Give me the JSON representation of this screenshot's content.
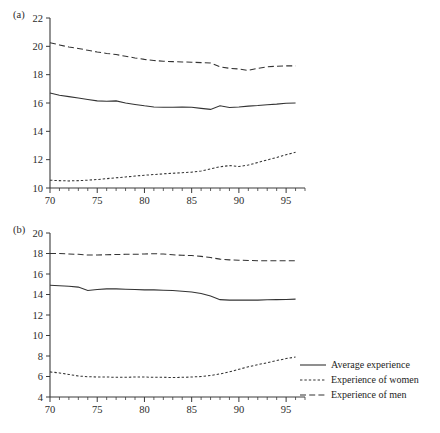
{
  "figure": {
    "panels": [
      {
        "label": "(a)",
        "name": "panel-a",
        "xlim": [
          70,
          97
        ],
        "ylim": [
          10,
          22
        ],
        "yticks": [
          10,
          12,
          14,
          16,
          18,
          20,
          22
        ],
        "xticks": [
          70,
          75,
          80,
          85,
          90,
          95
        ],
        "xminor_step": 1
      },
      {
        "label": "(b)",
        "name": "panel-b",
        "xlim": [
          70,
          97
        ],
        "ylim": [
          4,
          20
        ],
        "yticks": [
          4,
          6,
          8,
          10,
          12,
          14,
          16,
          18,
          20
        ],
        "xticks": [
          70,
          75,
          80,
          85,
          90,
          95
        ],
        "xminor_step": 1
      }
    ]
  },
  "legend": {
    "position": "right-bottom",
    "items": [
      {
        "label": "Average experience",
        "style": "solid",
        "key": "avg-line-key"
      },
      {
        "label": "Experience of women",
        "style": "dotted",
        "key": "women-line-key"
      },
      {
        "label": "Experience of men",
        "style": "dashed",
        "key": "men-line-key"
      }
    ]
  },
  "chart_data": [
    {
      "type": "line",
      "panel": "(a)",
      "title": "",
      "xlabel": "",
      "ylabel": "",
      "xlim": [
        70,
        97
      ],
      "ylim": [
        10,
        22
      ],
      "grid": false,
      "x": [
        70,
        71,
        72,
        73,
        74,
        75,
        76,
        77,
        78,
        79,
        80,
        81,
        82,
        83,
        84,
        85,
        86,
        87,
        88,
        89,
        90,
        91,
        92,
        93,
        94,
        95,
        96
      ],
      "series": [
        {
          "name": "Average experience",
          "style": "solid",
          "values": [
            16.7,
            16.55,
            16.45,
            16.35,
            16.25,
            16.15,
            16.12,
            16.15,
            16.0,
            15.9,
            15.8,
            15.72,
            15.7,
            15.7,
            15.72,
            15.7,
            15.62,
            15.55,
            15.8,
            15.68,
            15.72,
            15.78,
            15.82,
            15.88,
            15.92,
            15.98,
            16.0
          ]
        },
        {
          "name": "Experience of women",
          "style": "dotted",
          "values": [
            10.55,
            10.52,
            10.5,
            10.52,
            10.55,
            10.6,
            10.66,
            10.72,
            10.78,
            10.84,
            10.9,
            10.95,
            11.0,
            11.04,
            11.08,
            11.12,
            11.2,
            11.35,
            11.5,
            11.58,
            11.52,
            11.62,
            11.8,
            11.98,
            12.15,
            12.35,
            12.52
          ]
        },
        {
          "name": "Experience of men",
          "style": "dashed",
          "values": [
            20.25,
            20.1,
            19.95,
            19.85,
            19.72,
            19.6,
            19.5,
            19.42,
            19.3,
            19.18,
            19.08,
            19.0,
            18.95,
            18.92,
            18.9,
            18.88,
            18.85,
            18.82,
            18.55,
            18.45,
            18.4,
            18.3,
            18.45,
            18.55,
            18.6,
            18.62,
            18.62
          ]
        }
      ]
    },
    {
      "type": "line",
      "panel": "(b)",
      "title": "",
      "xlabel": "",
      "ylabel": "",
      "xlim": [
        70,
        97
      ],
      "ylim": [
        4,
        20
      ],
      "grid": false,
      "x": [
        70,
        71,
        72,
        73,
        74,
        75,
        76,
        77,
        78,
        79,
        80,
        81,
        82,
        83,
        84,
        85,
        86,
        87,
        88,
        89,
        90,
        91,
        92,
        93,
        94,
        95,
        96
      ],
      "series": [
        {
          "name": "Average experience",
          "style": "solid",
          "values": [
            14.9,
            14.85,
            14.8,
            14.72,
            14.4,
            14.48,
            14.55,
            14.55,
            14.52,
            14.48,
            14.45,
            14.45,
            14.42,
            14.38,
            14.32,
            14.25,
            14.1,
            13.85,
            13.5,
            13.45,
            13.45,
            13.45,
            13.45,
            13.48,
            13.5,
            13.52,
            13.55
          ]
        },
        {
          "name": "Experience of women",
          "style": "dotted",
          "values": [
            6.45,
            6.35,
            6.2,
            6.05,
            5.98,
            5.95,
            5.95,
            5.92,
            5.92,
            5.95,
            5.95,
            5.92,
            5.92,
            5.9,
            5.92,
            5.95,
            6.0,
            6.1,
            6.25,
            6.45,
            6.7,
            6.95,
            7.15,
            7.35,
            7.55,
            7.75,
            7.9
          ]
        },
        {
          "name": "Experience of men",
          "style": "dashed",
          "values": [
            18.0,
            18.0,
            17.95,
            17.92,
            17.85,
            17.85,
            17.88,
            17.9,
            17.92,
            17.92,
            17.95,
            17.98,
            17.95,
            17.88,
            17.82,
            17.8,
            17.72,
            17.6,
            17.45,
            17.38,
            17.35,
            17.32,
            17.3,
            17.3,
            17.3,
            17.3,
            17.3
          ]
        }
      ]
    }
  ]
}
